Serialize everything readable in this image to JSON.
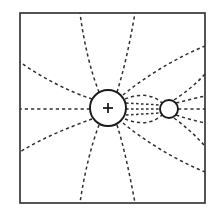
{
  "figure": {
    "background_color": "#ffffff",
    "line_color": "#303030",
    "frame_color": "#2b2b2b",
    "width": 213,
    "height": 216
  },
  "frame": {
    "label": "boundary-box",
    "x": 20,
    "y": 13,
    "width": 185,
    "height": 190,
    "stroke_width": 1.6
  },
  "charge": {
    "label": "positive-point-charge",
    "symbol": "+",
    "cx": 108,
    "cy": 108,
    "r": 18,
    "sign_arm": 5
  },
  "neutral_body": {
    "label": "neutral-conductor",
    "symbol": "",
    "cx": 169,
    "cy": 109,
    "r": 9
  },
  "chart_data": {
    "type": "line",
    "xlabel": "",
    "ylabel": "",
    "xlim": [
      20,
      205
    ],
    "ylim": [
      13,
      203
    ],
    "grid": false,
    "legend": null,
    "annotations": [
      {
        "text": "+",
        "x": 108,
        "y": 108
      }
    ],
    "markers": [
      {
        "name": "positive-point-charge",
        "cx": 108,
        "cy": 108,
        "r": 18,
        "label": "+"
      },
      {
        "name": "neutral-conductor",
        "cx": 169,
        "cy": 109,
        "r": 9,
        "label": ""
      }
    ],
    "series": [
      {
        "name": "field-line-left-horizontal",
        "style": "dashed",
        "path": "M 90 109 L 20 109"
      },
      {
        "name": "field-line-upper-left-shallow",
        "style": "dashed",
        "path": "M 92 99 C 70 92, 42 78, 20 62"
      },
      {
        "name": "field-line-lower-left-shallow",
        "style": "dashed",
        "path": "M 92 119 C 70 127, 42 138, 20 152"
      },
      {
        "name": "field-line-upper-left-steep",
        "style": "dashed",
        "path": "M 99 92 C 91 72, 84 44, 80 13"
      },
      {
        "name": "field-line-lower-left-steep",
        "style": "dashed",
        "path": "M 99 125 C 91 146, 84 175, 80 203"
      },
      {
        "name": "field-line-upper-right-steep",
        "style": "dashed",
        "path": "M 117 92 C 124 70, 130 42, 135 13"
      },
      {
        "name": "field-line-lower-right-steep",
        "style": "dashed",
        "path": "M 117 125 C 124 147, 130 176, 135 203"
      },
      {
        "name": "field-line-upper-right-to-edge",
        "style": "dashed",
        "path": "M 123 95 C 146 76, 176 58, 205 46"
      },
      {
        "name": "field-line-lower-right-to-edge",
        "style": "dashed",
        "path": "M 123 123 C 146 142, 176 160, 205 172"
      },
      {
        "name": "field-line-upper-right-to-sphere",
        "style": "dashed",
        "path": "M 125 99 C 142 92, 155 96, 162 103"
      },
      {
        "name": "field-line-lower-right-to-sphere",
        "style": "dashed",
        "path": "M 125 119 C 142 126, 155 122, 162 115"
      },
      {
        "name": "bridge-line-upper",
        "style": "dashed",
        "path": "M 126 103 L 160 105"
      },
      {
        "name": "bridge-line-middle",
        "style": "dashed",
        "path": "M 126 109 L 160 109"
      },
      {
        "name": "bridge-line-lower",
        "style": "dashed",
        "path": "M 126 115 L 160 113"
      },
      {
        "name": "exit-line-right-horizontal",
        "style": "dashed",
        "path": "M 178 109 L 205 109"
      },
      {
        "name": "exit-line-right-upper",
        "style": "dashed",
        "path": "M 176 103 C 188 100, 196 98, 205 96"
      },
      {
        "name": "exit-line-right-lower",
        "style": "dashed",
        "path": "M 176 115 C 188 119, 196 121, 205 123"
      },
      {
        "name": "exit-line-right-upper-far",
        "style": "dashed",
        "path": "M 174 100 C 186 92, 196 84, 205 74"
      },
      {
        "name": "exit-line-right-lower-far",
        "style": "dashed",
        "path": "M 174 118 C 186 127, 196 136, 205 146"
      }
    ]
  }
}
